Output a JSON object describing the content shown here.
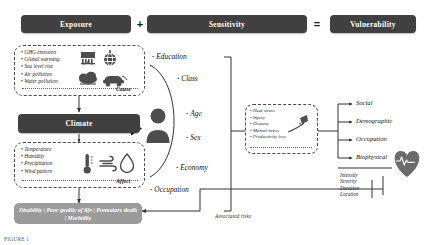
{
  "equation": {
    "exposure_label": "Exposure",
    "plus_symbol": "+",
    "sensitivity_label": "Sensitivity",
    "equals_symbol": "=",
    "vulnerability_label": "Vulnerability"
  },
  "exposure_box": {
    "items": [
      "GHG emission",
      "Global warming",
      "Sea level rise",
      "Air pollution",
      "Water pollution"
    ],
    "tag": "Cause",
    "icons": [
      "factory-icon",
      "globe-icon",
      "rain-cloud-icon",
      "car-icon"
    ]
  },
  "climate": {
    "title": "Climate",
    "items": [
      "Temperature",
      "Humidity",
      "Precipitation",
      "Wind pattern"
    ],
    "tag": "Affect",
    "icons": [
      "thermometer-icon",
      "wind-icon",
      "water-drop-icon"
    ]
  },
  "sensitivity_attributes": [
    "- Education",
    "- Class",
    "- Age",
    "- Sex",
    "- Economy",
    "- Occupation"
  ],
  "health_effects": {
    "items": [
      "Heat stress",
      "Injury",
      "Disease",
      "Mental stress",
      "Productivity loss"
    ],
    "icon": "syringe-icon"
  },
  "vulnerability_outcomes": [
    "Social",
    "Demographic",
    "Occupation",
    "Biophysical"
  ],
  "risk_attributes": [
    "Intensity",
    "Severity",
    "Duration",
    "Location"
  ],
  "outcomes_bar": {
    "text": "Disability | Poor quality of life | Premature death | Morbidity"
  },
  "associated_risks_label": "Associated risks",
  "figure_caption": "FIGURE 1",
  "colors": {
    "header_bar": "#404040",
    "outcome_pill": "#9b9b9b",
    "icon_gray": "#4d4d4d",
    "line": "#333333"
  }
}
